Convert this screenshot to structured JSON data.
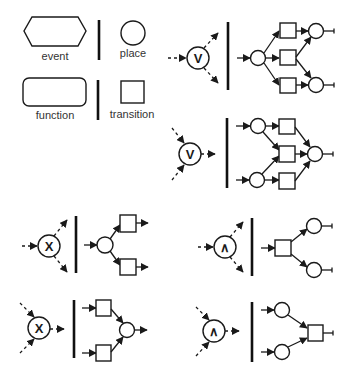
{
  "legend": {
    "event_label": "event",
    "function_label": "function",
    "place_label": "place",
    "transition_label": "transition"
  },
  "operators": {
    "or_split": "V",
    "or_join": "V",
    "xor_split": "X",
    "xor_join": "X",
    "and_split": "∧",
    "and_join": "∧"
  },
  "colors": {
    "stroke": "#1a1a1a",
    "background": "#ffffff",
    "label": "#333333"
  }
}
